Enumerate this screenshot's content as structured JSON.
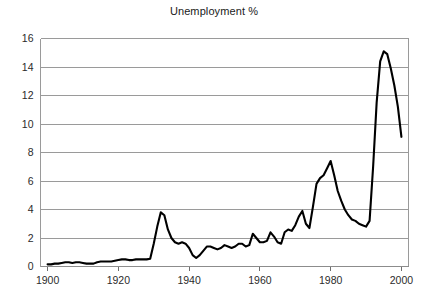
{
  "chart_data": {
    "type": "line",
    "title": "Unemployment %",
    "xlabel": "",
    "ylabel": "",
    "xlim": [
      1898,
      2002
    ],
    "ylim": [
      0,
      16
    ],
    "yticks": [
      0,
      2,
      4,
      6,
      8,
      10,
      12,
      14,
      16
    ],
    "xticks": [
      1900,
      1920,
      1940,
      1960,
      1980,
      2000
    ],
    "grid": true,
    "legend": false,
    "legend_position": "none",
    "line_color": "#000000",
    "series": [
      {
        "name": "Unemployment %",
        "x": [
          1900,
          1901,
          1902,
          1903,
          1904,
          1905,
          1906,
          1907,
          1908,
          1909,
          1910,
          1911,
          1912,
          1913,
          1914,
          1915,
          1916,
          1917,
          1918,
          1919,
          1920,
          1921,
          1922,
          1923,
          1924,
          1925,
          1926,
          1927,
          1928,
          1929,
          1930,
          1931,
          1932,
          1933,
          1934,
          1935,
          1936,
          1937,
          1938,
          1939,
          1940,
          1941,
          1942,
          1943,
          1944,
          1945,
          1946,
          1947,
          1948,
          1949,
          1950,
          1951,
          1952,
          1953,
          1954,
          1955,
          1956,
          1957,
          1958,
          1959,
          1960,
          1961,
          1962,
          1963,
          1964,
          1965,
          1966,
          1967,
          1968,
          1969,
          1970,
          1971,
          1972,
          1973,
          1974,
          1975,
          1976,
          1977,
          1978,
          1979,
          1980,
          1981,
          1982,
          1983,
          1984,
          1985,
          1986,
          1987,
          1988,
          1989,
          1990,
          1991,
          1992,
          1993,
          1994,
          1995,
          1996,
          1997,
          1998,
          1999,
          2000
        ],
        "values": [
          0.15,
          0.15,
          0.2,
          0.2,
          0.25,
          0.3,
          0.3,
          0.25,
          0.3,
          0.3,
          0.25,
          0.2,
          0.2,
          0.2,
          0.3,
          0.35,
          0.35,
          0.35,
          0.35,
          0.4,
          0.45,
          0.5,
          0.5,
          0.45,
          0.45,
          0.5,
          0.5,
          0.5,
          0.5,
          0.55,
          1.6,
          2.8,
          3.8,
          3.6,
          2.6,
          2.0,
          1.7,
          1.6,
          1.7,
          1.6,
          1.3,
          0.8,
          0.6,
          0.8,
          1.1,
          1.4,
          1.4,
          1.3,
          1.2,
          1.3,
          1.5,
          1.4,
          1.3,
          1.4,
          1.6,
          1.6,
          1.4,
          1.5,
          2.3,
          2.0,
          1.7,
          1.7,
          1.8,
          2.4,
          2.1,
          1.7,
          1.6,
          2.4,
          2.6,
          2.5,
          2.9,
          3.5,
          3.9,
          3.0,
          2.7,
          4.2,
          5.8,
          6.2,
          6.4,
          6.9,
          7.4,
          6.4,
          5.3,
          4.6,
          4.0,
          3.6,
          3.3,
          3.2,
          3.0,
          2.9,
          2.8,
          3.2,
          7.0,
          11.5,
          14.4,
          15.1,
          14.9,
          13.9,
          12.7,
          11.2,
          9.1
        ]
      }
    ]
  },
  "axes": {
    "y_tick_labels": [
      "16",
      "14",
      "12",
      "10",
      "8",
      "6",
      "4",
      "2",
      "0"
    ],
    "x_tick_labels": [
      "1900",
      "1920",
      "1940",
      "1960",
      "1980",
      "2000"
    ]
  }
}
